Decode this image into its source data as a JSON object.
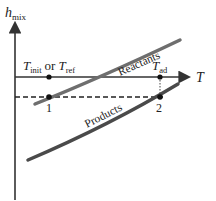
{
  "diagram": {
    "y_axis": {
      "symbol": "h",
      "subscript": "mix"
    },
    "x_axis": {
      "symbol": "T"
    },
    "temps": {
      "init_symbol": "T",
      "init_sub": "init",
      "or_text": "or",
      "ref_symbol": "T",
      "ref_sub": "ref",
      "ad_symbol": "T",
      "ad_sub": "ad"
    },
    "curves": [
      {
        "name": "Reactants",
        "color": "#6e6e6e"
      },
      {
        "name": "Products",
        "color": "#4a4a4a"
      }
    ],
    "points": [
      {
        "label": "1"
      },
      {
        "label": "2"
      }
    ],
    "colors": {
      "axis": "#333333",
      "dashed": "#222222",
      "points": "#111111"
    }
  }
}
